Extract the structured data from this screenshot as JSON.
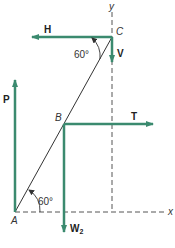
{
  "diagram": {
    "colors": {
      "force": "#3b8a6f",
      "line": "#333333",
      "dash": "#555555"
    },
    "axes": {
      "x_label": "x",
      "y_label": "y"
    },
    "points": {
      "A": "A",
      "B": "B",
      "C": "C"
    },
    "forces": {
      "H": "H",
      "V": "V",
      "P": "P",
      "T": "T",
      "W2_main": "W",
      "W2_sub": "2"
    },
    "angles": {
      "at_C": "60°",
      "at_A": "60°"
    }
  }
}
